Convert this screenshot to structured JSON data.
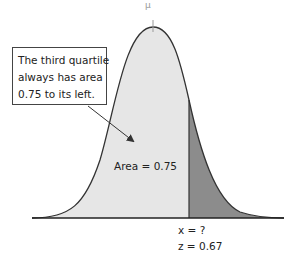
{
  "top_mark": "μ",
  "callout": {
    "lines": [
      "The third quartile",
      "always has area",
      "0.75 to its left."
    ]
  },
  "area_label": "Area = 0.75",
  "x_label": "x = ?",
  "z_label": "z = 0.67",
  "colors": {
    "left_fill": "#e6e6e6",
    "right_fill": "#8c8c8c",
    "curve": "#333333"
  }
}
